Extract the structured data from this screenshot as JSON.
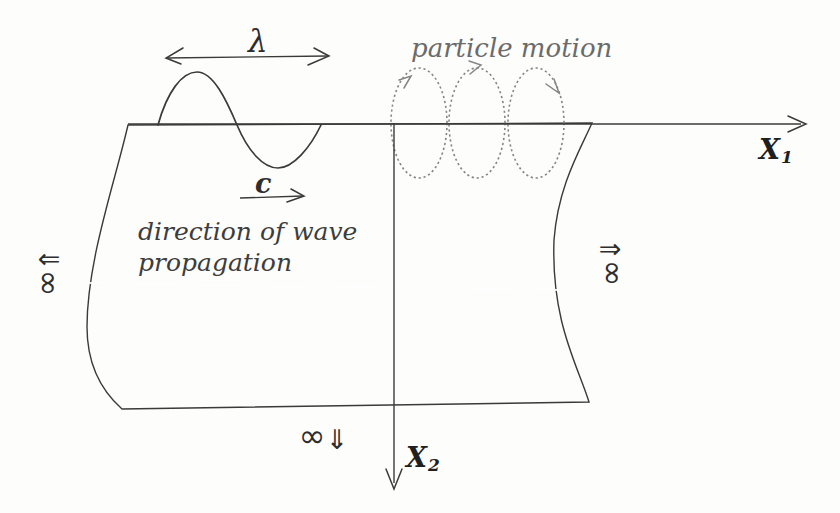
{
  "figure": {
    "wavelength": "λ",
    "phase_velocity": "c",
    "particle_motion": "particle motion",
    "direction_line1": "direction of wave",
    "direction_line2": "propagation",
    "x1": {
      "letter": "X",
      "sub": "1"
    },
    "x2": {
      "letter": "X",
      "sub": "2"
    },
    "infinity": {
      "symbol": "∞",
      "left_arrow": "⇐",
      "right_arrow": "⇒",
      "down_arrow": "⇓"
    },
    "colors": {
      "medium_fill": "#d8d7d3",
      "line": "#3a3a3a",
      "orbit": "#858585",
      "muted_text": "#6b6b6b",
      "dark_text": "#3d3d3d",
      "background": "#fdfdfb"
    }
  }
}
